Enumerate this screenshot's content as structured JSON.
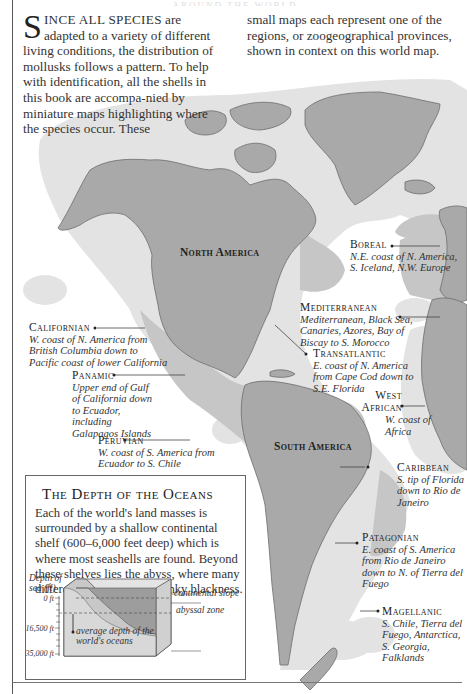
{
  "header": {
    "title_fragment": "AROUND THE WORLD"
  },
  "intro": {
    "dropcap": "S",
    "smallcaps_lead": "INCE ALL SPECIES",
    "left_text": " are adapted to a variety of different living conditions, the distribution of mollusks follows a pattern. To help with identification, all the shells in this book are accompa-nied by miniature maps highlighting where the species occur. These",
    "right_text": "small maps each represent one of the regions, or zoogeographical provinces, shown in context on this world map."
  },
  "continents": {
    "north_america": "North America",
    "south_america": "South America"
  },
  "provinces": [
    {
      "id": "boreal",
      "name": "Boreal",
      "desc": "N.E. coast of N. America, S. Iceland, N.W. Europe"
    },
    {
      "id": "mediterranean",
      "name": "Mediterranean",
      "desc": "Mediterranean, Black Sea, Canaries, Azores, Bay of Biscay to S. Morocco"
    },
    {
      "id": "transatlantic",
      "name": "Transatlantic",
      "desc": "E. coast of N. America from Cape Cod down to S.E. Florida"
    },
    {
      "id": "west_african",
      "name": "West African",
      "desc": "W. coast of Africa"
    },
    {
      "id": "californian",
      "name": "Californian",
      "desc": "W. coast of N. America from British Columbia down to Pacific coast of lower California"
    },
    {
      "id": "panamic",
      "name": "Panamic",
      "desc": "Upper end of Gulf of California down to Ecuador, including Galapagos Islands"
    },
    {
      "id": "peruvian",
      "name": "Peruvian",
      "desc": "W. coast of S. America from Ecuador to S. Chile"
    },
    {
      "id": "caribbean",
      "name": "Caribbean",
      "desc": "S. tip of Florida down to Rio de Janeiro"
    },
    {
      "id": "patagonian",
      "name": "Patagonian",
      "desc": "E. coast of S. America from Rio de Janeiro down to N. of Tierra del Fuego"
    },
    {
      "id": "magellanic",
      "name": "Magellanic",
      "desc": "S. Chile, Tierra del Fuego, Antarctica, S. Georgia, Falklands"
    }
  ],
  "depth_box": {
    "title": "The Depth of the Oceans",
    "text": "Each of the world's land masses is surrounded by a shallow continental shelf (600–6,000 feet deep) which is where most seashells are found. Beyond these shelves lies the abyss, where many different mollusks live in inky blackness.",
    "diagram": {
      "axis_title": "Depth of sea (ft)",
      "ticks": [
        "0 ft",
        "16,500 ft",
        "35,000 ft"
      ],
      "labels": {
        "slope": "continental slope",
        "abyss": "abyssal zone",
        "average": "average depth of the world's oceans"
      }
    }
  },
  "colors": {
    "land": "#a9a9a9",
    "shelf_light": "#e2e2e2",
    "shelf_dark": "#c7c7c7",
    "coast": "#6d6d6d",
    "text": "#2a2a2a"
  }
}
